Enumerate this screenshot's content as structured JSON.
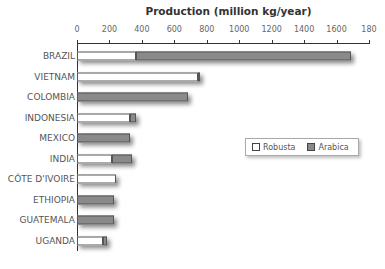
{
  "chart_data": {
    "type": "bar",
    "orientation": "horizontal",
    "stacked": true,
    "title": "Production (million kg/year)",
    "xlabel": "",
    "ylabel": "",
    "xlim": [
      0,
      1800
    ],
    "xticks": [
      0,
      200,
      400,
      600,
      800,
      1000,
      1200,
      1400,
      1600,
      1800
    ],
    "tick_labels": [
      "0",
      "200",
      "400",
      "600",
      "800",
      "1000",
      "1200",
      "1400",
      "1600",
      "180"
    ],
    "grid": false,
    "legend_position": "right-middle",
    "categories": [
      "BRAZIL",
      "VIETNAM",
      "COLOMBIA",
      "INDONESIA",
      "MEXICO",
      "INDIA",
      "CÔTE D'IVOIRE",
      "ETHIOPIA",
      "GUATEMALA",
      "UGANDA"
    ],
    "series": [
      {
        "name": "Robusta",
        "color": "#ffffff",
        "values": [
          365,
          745,
          0,
          325,
          0,
          215,
          240,
          0,
          0,
          160
        ]
      },
      {
        "name": "Arabica",
        "color": "#8a8a8a",
        "values": [
          1325,
          15,
          685,
          40,
          325,
          125,
          0,
          228,
          228,
          25
        ]
      }
    ]
  },
  "legend": {
    "robusta": "Robusta",
    "arabica": "Arabica"
  }
}
